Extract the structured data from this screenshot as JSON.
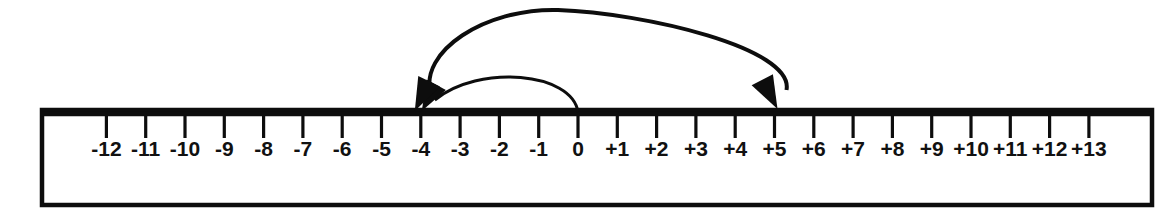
{
  "diagram": {
    "background_color": "#ffffff",
    "ink_color": "#0d0d0d"
  },
  "chart_data": {
    "type": "number-line",
    "title": "",
    "xlabel": "",
    "ylabel": "",
    "axis_range": [
      -12,
      13
    ],
    "tick_step": 1,
    "grid": false,
    "legend": false,
    "tick_labels": [
      "-12",
      "-11",
      "-10",
      "-9",
      "-8",
      "-7",
      "-6",
      "-5",
      "-4",
      "-3",
      "-2",
      "-1",
      "0",
      "+1",
      "+2",
      "+3",
      "+4",
      "+5",
      "+6",
      "+7",
      "+8",
      "+9",
      "+10",
      "+11",
      "+12",
      "+13"
    ],
    "tick_values": [
      -12,
      -11,
      -10,
      -9,
      -8,
      -7,
      -6,
      -5,
      -4,
      -3,
      -2,
      -1,
      0,
      1,
      2,
      3,
      4,
      5,
      6,
      7,
      8,
      9,
      10,
      11,
      12,
      13
    ],
    "arcs": [
      {
        "name": "small-arc",
        "from": 0,
        "to": -4,
        "direction": "left",
        "arrowhead": "end",
        "height": "short",
        "stroke_width": 3.0
      },
      {
        "name": "large-arc",
        "from": -4,
        "to": 5,
        "direction": "right",
        "arrowhead": "both",
        "height": "tall",
        "stroke_width": 4.0
      }
    ]
  },
  "geometry": {
    "frame": {
      "x": 42,
      "y": 110,
      "width": 1110,
      "height": 95
    },
    "axis_y": 114,
    "origin_x": 578,
    "unit_px": 39.3,
    "tick_length": 22,
    "label_baseline_y": 156
  }
}
